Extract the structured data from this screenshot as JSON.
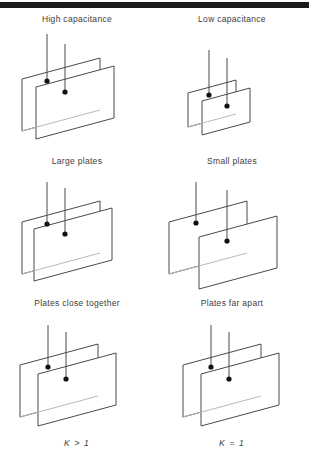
{
  "page": {
    "background_color": "#ffffff",
    "rule_color": "#1a1a1a",
    "line_color": "#4a4a4a",
    "text_color": "#3c3c3c"
  },
  "diagram": {
    "title_left": "High capacitance",
    "title_right": "Low capacitance",
    "rows": [
      {
        "name": "plate-area",
        "left": {
          "caption": "Large plates",
          "plate_width": 78,
          "plate_height": 52,
          "plate_gap": 14,
          "leads": 2,
          "terminals": 2
        },
        "right": {
          "caption": "Small plates",
          "plate_width": 48,
          "plate_height": 34,
          "plate_gap": 14,
          "leads": 2,
          "terminals": 2
        }
      },
      {
        "name": "plate-separation",
        "left": {
          "caption": "Plates close together",
          "plate_width": 78,
          "plate_height": 52,
          "plate_gap": 12,
          "leads": 2,
          "terminals": 2
        },
        "right": {
          "caption": "Plates far apart",
          "plate_width": 78,
          "plate_height": 52,
          "plate_gap": 30,
          "leads": 2,
          "terminals": 2
        }
      },
      {
        "name": "dielectric-constant",
        "left": {
          "caption": "K > 1",
          "plate_width": 78,
          "plate_height": 52,
          "plate_gap": 18,
          "leads": 2,
          "terminals": 2
        },
        "right": {
          "caption": "K = 1",
          "plate_width": 78,
          "plate_height": 52,
          "plate_gap": 18,
          "leads": 2,
          "terminals": 2
        }
      }
    ]
  }
}
